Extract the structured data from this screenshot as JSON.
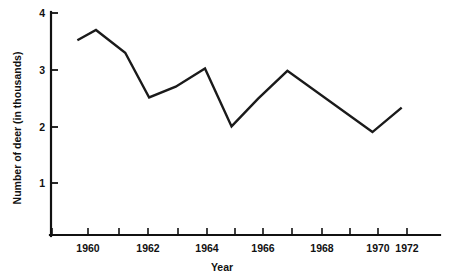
{
  "chart_data": {
    "type": "line",
    "title": "",
    "xlabel": "Year",
    "ylabel": "Number of deer (in thousands)",
    "xlim": [
      1959,
      1972.5
    ],
    "ylim": [
      0,
      4
    ],
    "grid": false,
    "legend": "none",
    "line_color": "#1a1a1a",
    "x": [
      1959.6,
      1960.3,
      1961.4,
      1962.3,
      1963.3,
      1964.4,
      1965.4,
      1966.4,
      1967.5,
      1970.7,
      1971.8
    ],
    "y": [
      3.52,
      3.7,
      3.3,
      2.51,
      2.7,
      3.02,
      2.0,
      2.49,
      2.98,
      1.9,
      2.33
    ],
    "points": [
      {
        "x": 1959.6,
        "y": 3.52
      },
      {
        "x": 1960.3,
        "y": 3.7
      },
      {
        "x": 1961.4,
        "y": 3.3
      },
      {
        "x": 1962.3,
        "y": 2.51
      },
      {
        "x": 1963.3,
        "y": 2.7
      },
      {
        "x": 1964.4,
        "y": 3.02
      },
      {
        "x": 1965.4,
        "y": 2.0
      },
      {
        "x": 1966.4,
        "y": 2.49
      },
      {
        "x": 1967.5,
        "y": 2.98
      },
      {
        "x": 1970.7,
        "y": 1.9
      },
      {
        "x": 1971.8,
        "y": 2.33
      }
    ],
    "y_ticks": [
      1,
      2,
      3,
      4
    ],
    "y_tick_labels": [
      "1",
      "2",
      "3",
      "4"
    ],
    "x_ticks": [
      1959,
      1960,
      1961,
      1962,
      1963,
      1964,
      1965,
      1966,
      1967,
      1968,
      1969,
      1970,
      1971,
      1972
    ],
    "x_tick_labels": [
      "1960",
      "1962",
      "1964",
      "1966",
      "1968",
      "1970",
      "1972"
    ],
    "x_labeled_ticks": [
      1960,
      1962,
      1964,
      1966,
      1968,
      1970,
      1972
    ]
  },
  "axes": {
    "y_label": "Number of deer (in thousands)",
    "x_label": "Year",
    "y_tick_0": "1",
    "y_tick_1": "2",
    "y_tick_2": "3",
    "y_tick_3": "4",
    "x_tick_0": "1960",
    "x_tick_1": "1962",
    "x_tick_2": "1964",
    "x_tick_3": "1966",
    "x_tick_4": "1968",
    "x_tick_5": "1970",
    "x_tick_6": "1972"
  }
}
